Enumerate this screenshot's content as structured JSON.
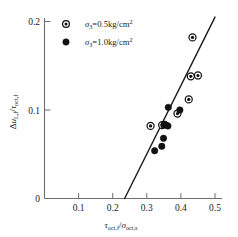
{
  "chart_data": {
    "type": "scatter",
    "title": "",
    "xlabel": "τoct,f / σoct,s",
    "ylabel": "ΔuL,f / τoct,f",
    "xlim": [
      0,
      0.52
    ],
    "ylim": [
      0,
      0.212
    ],
    "grid": false,
    "xticks": [
      0.1,
      0.2,
      0.3,
      0.4,
      0.5
    ],
    "xtick_labels": [
      "0.1",
      "0.2",
      "0.3",
      "0.4",
      "0.5"
    ],
    "yticks": [
      0,
      0.1,
      0.2
    ],
    "ytick_labels": [
      "0",
      "0.1",
      "0.2"
    ],
    "legend_position": "top-left",
    "series": [
      {
        "name": "σ3=0.5kg/cm2",
        "marker": "circle-dot",
        "points": [
          {
            "x": 0.311,
            "y": 0.082
          },
          {
            "x": 0.345,
            "y": 0.083
          },
          {
            "x": 0.39,
            "y": 0.096
          },
          {
            "x": 0.423,
            "y": 0.112
          },
          {
            "x": 0.429,
            "y": 0.138
          },
          {
            "x": 0.45,
            "y": 0.139
          },
          {
            "x": 0.434,
            "y": 0.182
          }
        ]
      },
      {
        "name": "σ3=1.0kg/cm2",
        "marker": "filled-circle",
        "points": [
          {
            "x": 0.323,
            "y": 0.054
          },
          {
            "x": 0.344,
            "y": 0.059
          },
          {
            "x": 0.349,
            "y": 0.068
          },
          {
            "x": 0.35,
            "y": 0.083
          },
          {
            "x": 0.356,
            "y": 0.083
          },
          {
            "x": 0.362,
            "y": 0.082
          },
          {
            "x": 0.363,
            "y": 0.103
          },
          {
            "x": 0.397,
            "y": 0.1
          },
          {
            "x": 0.352,
            "y": 0.084
          }
        ]
      }
    ],
    "trendline": {
      "x_start": 0.235,
      "y_start": 0.0,
      "x_end": 0.5,
      "y_end": 0.205
    },
    "annotations": []
  },
  "axes": {
    "y_label_parts": {
      "delta": "Δ",
      "u": "u",
      "u_sub": "L,f",
      "slash": "/",
      "tau": "τ",
      "tau_sub": "oct,f"
    },
    "x_label_parts": {
      "tau": "τ",
      "tau_sub": "oct,f",
      "slash": "/",
      "sigma": "σ",
      "sigma_sub": "oct,s"
    }
  },
  "legend": {
    "entries": [
      {
        "marker_name": "legend-marker-open",
        "sigma": "σ",
        "sigma_sub": "3",
        "equals_value": "=0.5kg/cm",
        "exponent": "2"
      },
      {
        "marker_name": "legend-marker-filled",
        "sigma": "σ",
        "sigma_sub": "3",
        "equals_value": "=1.0kg/cm",
        "exponent": "2"
      }
    ]
  },
  "colors": {
    "axis": "#6e6e6e",
    "marker": "#111111",
    "trendline": "#1a1a1a",
    "background": "#ffffff"
  }
}
